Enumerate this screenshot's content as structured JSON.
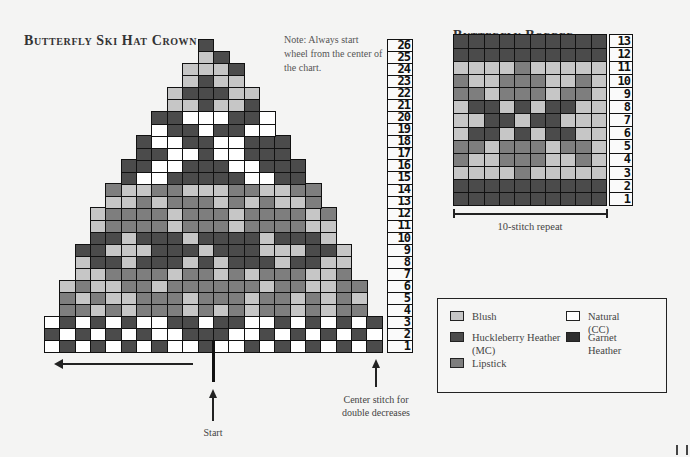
{
  "crown": {
    "title": "Butterfly Ski Hat Crown",
    "note": "Note: Always start wheel from the center of the chart.",
    "columns": 22,
    "rows_bottom_up": [
      {
        "row": 1,
        "start_col": 1,
        "cells": "WDWDWDWDWWDWWDWDWDWDWD"
      },
      {
        "row": 2,
        "start_col": 1,
        "cells": "DWDWDWDWWDDDWWDWDWDWDW"
      },
      {
        "row": 3,
        "start_col": 1,
        "cells": "WDWDWDWWDDWDDWWDWDWDWD"
      },
      {
        "row": 4,
        "start_col": 2,
        "cells": "LLBLBLLLBLBLBLLBLBLL"
      },
      {
        "row": 5,
        "start_col": 2,
        "cells": "LBLBBLLLBLLLBLLBLBLB"
      },
      {
        "row": 6,
        "start_col": 2,
        "cells": "BLBBLLBLLLLLLBLLBBLL"
      },
      {
        "row": 7,
        "start_col": 3,
        "cells": "BBLLLLBLLBLBLLLBBL"
      },
      {
        "row": 8,
        "start_col": 3,
        "cells": "BDDBDDDBDBDDDBDDBB"
      },
      {
        "row": 9,
        "start_col": 3,
        "cells": "DDBBBDDDBDDDBBBDDB"
      },
      {
        "row": 10,
        "start_col": 4,
        "cells": "DDBDDDBDDDDBDDDB"
      },
      {
        "row": 11,
        "start_col": 4,
        "cells": "BLLLLBLLLBLLLLBB"
      },
      {
        "row": 12,
        "start_col": 4,
        "cells": "BLLLLBLLLBLLLLBL"
      },
      {
        "row": 13,
        "start_col": 5,
        "cells": "BBLBLLLBLBLBBL"
      },
      {
        "row": 14,
        "start_col": 5,
        "cells": "LBBLLBBBLLBBLL"
      },
      {
        "row": 15,
        "start_col": 6,
        "cells": "DWWDDDDDWWDD"
      },
      {
        "row": 16,
        "start_col": 6,
        "cells": "DDWWDDDWWDDD"
      },
      {
        "row": 17,
        "start_col": 7,
        "cells": "DDWWDWWDDD"
      },
      {
        "row": 18,
        "start_col": 7,
        "cells": "DWWDDWWDDD"
      },
      {
        "row": 19,
        "start_col": 8,
        "cells": "WDDWDDWW"
      },
      {
        "row": 20,
        "start_col": 8,
        "cells": "DDWWWDDW"
      },
      {
        "row": 21,
        "start_col": 9,
        "cells": "BBDBBD"
      },
      {
        "row": 22,
        "start_col": 9,
        "cells": "BDDDBB"
      },
      {
        "row": 23,
        "start_col": 10,
        "cells": "BDBB"
      },
      {
        "row": 24,
        "start_col": 10,
        "cells": "BBBD"
      },
      {
        "row": 25,
        "start_col": 11,
        "cells": "BD"
      },
      {
        "row": 26,
        "start_col": 11,
        "cells": "D"
      }
    ],
    "row_numbers": [
      "1",
      "2",
      "3",
      "4",
      "5",
      "6",
      "7",
      "8",
      "9",
      "10",
      "11",
      "12",
      "13",
      "14",
      "15",
      "16",
      "17",
      "18",
      "19",
      "20",
      "21",
      "22",
      "23",
      "24",
      "25",
      "26"
    ],
    "labels": {
      "start": "Start",
      "center_stitch": "Center stitch for double decreases"
    }
  },
  "border": {
    "title": "Butterfly Border",
    "repeat_label": "10-stitch repeat",
    "rows_bottom_up": [
      {
        "row": 1,
        "cells": "DDDDDDDDDD"
      },
      {
        "row": 2,
        "cells": "DDDDDDDDDD"
      },
      {
        "row": 3,
        "cells": "BBBBLBBBBB"
      },
      {
        "row": 4,
        "cells": "LBBLLLBBLB"
      },
      {
        "row": 5,
        "cells": "LLBLLLBLLB"
      },
      {
        "row": 6,
        "cells": "BDDBDBDDBB"
      },
      {
        "row": 7,
        "cells": "BBDDBDDBBB"
      },
      {
        "row": 8,
        "cells": "BDDBDBDDBB"
      },
      {
        "row": 9,
        "cells": "LLBLLLBLLB"
      },
      {
        "row": 10,
        "cells": "LBBLLLBBLB"
      },
      {
        "row": 11,
        "cells": "BBBBLBBBBB"
      },
      {
        "row": 12,
        "cells": "DDDDDDDDDD"
      },
      {
        "row": 13,
        "cells": "DDDDDDDDDD"
      }
    ],
    "row_numbers": [
      "1",
      "2",
      "3",
      "4",
      "5",
      "6",
      "7",
      "8",
      "9",
      "10",
      "11",
      "12",
      "13"
    ]
  },
  "legend": {
    "items": [
      {
        "code": "B",
        "name": "Blush",
        "color": "#c6c6c6"
      },
      {
        "code": "W",
        "name": "Natural (CC)",
        "color": "#ffffff"
      },
      {
        "code": "D",
        "name": "Huckleberry Heather\n(MC)",
        "color": "#4b4b4b"
      },
      {
        "code": "G",
        "name": "Garnet\nHeather",
        "color": "#2e2e2e"
      },
      {
        "code": "L",
        "name": "Lipstick",
        "color": "#7e7e7e"
      }
    ]
  }
}
